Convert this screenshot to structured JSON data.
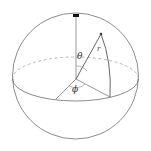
{
  "diagram": {
    "labels": {
      "theta": "θ",
      "phi": "ϕ",
      "r": "r"
    },
    "colors": {
      "stroke": "#6e6e6e",
      "dashed": "#9a9a9a",
      "marker": "#111111",
      "background": "#ffffff"
    }
  }
}
